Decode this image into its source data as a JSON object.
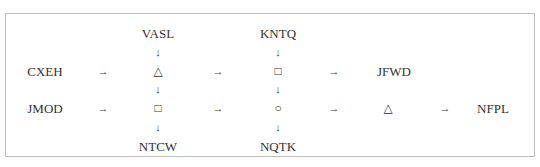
{
  "diagram": {
    "nodes": [
      {
        "id": "vasl",
        "label": "VASL",
        "x": 158,
        "y": 33
      },
      {
        "id": "kntq",
        "label": "KNTQ",
        "x": 278,
        "y": 33
      },
      {
        "id": "cxeh",
        "label": "CXEH",
        "x": 45,
        "y": 71
      },
      {
        "id": "tri1",
        "label": "△",
        "x": 158,
        "y": 71
      },
      {
        "id": "sq1",
        "label": "□",
        "x": 278,
        "y": 71
      },
      {
        "id": "jfwd",
        "label": "JFWD",
        "x": 394,
        "y": 71
      },
      {
        "id": "jmod",
        "label": "JMOD",
        "x": 45,
        "y": 108
      },
      {
        "id": "sq2",
        "label": "□",
        "x": 158,
        "y": 108
      },
      {
        "id": "circ",
        "label": "○",
        "x": 278,
        "y": 108
      },
      {
        "id": "tri2",
        "label": "△",
        "x": 388,
        "y": 108
      },
      {
        "id": "nfpl",
        "label": "NFPL",
        "x": 493,
        "y": 108
      },
      {
        "id": "ntcw",
        "label": "NTCW",
        "x": 158,
        "y": 146
      },
      {
        "id": "nqtk",
        "label": "NQTK",
        "x": 278,
        "y": 146
      }
    ],
    "arrows": [
      {
        "glyph": "↓",
        "x": 158,
        "y": 52
      },
      {
        "glyph": "↓",
        "x": 278,
        "y": 52
      },
      {
        "glyph": "→",
        "x": 103,
        "y": 71
      },
      {
        "glyph": "→",
        "x": 218,
        "y": 71
      },
      {
        "glyph": "→",
        "x": 334,
        "y": 71
      },
      {
        "glyph": "↓",
        "x": 158,
        "y": 89
      },
      {
        "glyph": "↓",
        "x": 278,
        "y": 89
      },
      {
        "glyph": "→",
        "x": 103,
        "y": 108
      },
      {
        "glyph": "→",
        "x": 218,
        "y": 108
      },
      {
        "glyph": "→",
        "x": 334,
        "y": 108
      },
      {
        "glyph": "→",
        "x": 445,
        "y": 108
      },
      {
        "glyph": "↓",
        "x": 158,
        "y": 127
      },
      {
        "glyph": "↓",
        "x": 278,
        "y": 127
      }
    ]
  }
}
